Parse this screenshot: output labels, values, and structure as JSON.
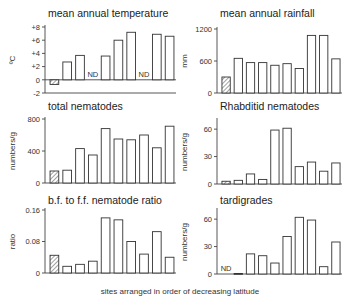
{
  "figure": {
    "xlabel": "sites arranged in order of decreasing latitude"
  },
  "chart_data": [
    {
      "id": "temperature",
      "type": "bar",
      "title": "mean annual temperature",
      "ylabel": "ºC",
      "ylim": [
        -2,
        8
      ],
      "yticks": [
        8,
        6,
        4,
        2,
        0,
        -2
      ],
      "ytick_labels": [
        "+8",
        "+6",
        "+4",
        "+2",
        "0",
        "-2"
      ],
      "categories": [
        "site 1",
        "site 2",
        "site 3",
        "site 4",
        "site 5",
        "site 6",
        "site 7",
        "site 8",
        "site 9",
        "site 10"
      ],
      "values": [
        -0.7,
        2.7,
        3.7,
        null,
        3.6,
        6.0,
        7.2,
        null,
        6.9,
        6.6
      ],
      "hatched": [
        true,
        false,
        false,
        false,
        false,
        false,
        false,
        false,
        false,
        false
      ],
      "nd_label": "ND",
      "baseline_line": true
    },
    {
      "id": "rainfall",
      "type": "bar",
      "title": "mean annual rainfall",
      "ylabel": "mm",
      "ylim": [
        0,
        1200
      ],
      "yticks": [
        1200,
        600,
        0
      ],
      "ytick_labels": [
        "1200",
        "600",
        "0"
      ],
      "categories": [
        "site 1",
        "site 2",
        "site 3",
        "site 4",
        "site 5",
        "site 6",
        "site 7",
        "site 8",
        "site 9",
        "site 10"
      ],
      "values": [
        300,
        650,
        570,
        570,
        520,
        550,
        460,
        1080,
        1080,
        640
      ],
      "hatched": [
        true,
        false,
        false,
        false,
        false,
        false,
        false,
        false,
        false,
        false
      ],
      "nd_label": "ND"
    },
    {
      "id": "total-nematodes",
      "type": "bar",
      "title": "total nematodes",
      "ylabel": "numbers/g",
      "ylim": [
        0,
        800
      ],
      "yticks": [
        800,
        400,
        0
      ],
      "ytick_labels": [
        "800",
        "400",
        "0"
      ],
      "categories": [
        "site 1",
        "site 2",
        "site 3",
        "site 4",
        "site 5",
        "site 6",
        "site 7",
        "site 8",
        "site 9",
        "site 10"
      ],
      "values": [
        150,
        160,
        430,
        350,
        680,
        550,
        540,
        600,
        440,
        710
      ],
      "hatched": [
        true,
        false,
        false,
        false,
        false,
        false,
        false,
        false,
        false,
        false
      ],
      "nd_label": "ND"
    },
    {
      "id": "rhabditid-nematodes",
      "type": "bar",
      "title": "Rhabditid nematodes",
      "ylabel": "numbers/g",
      "ylim": [
        0,
        70
      ],
      "yticks": [
        60,
        30,
        0
      ],
      "ytick_labels": [
        "60",
        "30",
        "0"
      ],
      "categories": [
        "site 1",
        "site 2",
        "site 3",
        "site 4",
        "site 5",
        "site 6",
        "site 7",
        "site 8",
        "site 9",
        "site 10"
      ],
      "values": [
        3,
        4,
        11,
        5,
        59,
        61,
        19,
        24,
        14,
        23
      ],
      "hatched": [
        true,
        false,
        false,
        false,
        false,
        false,
        false,
        false,
        false,
        false
      ],
      "nd_label": "ND"
    },
    {
      "id": "bf-ff-ratio",
      "type": "bar",
      "title": "b.f. to f.f. nematode ratio",
      "ylabel": "ratio",
      "ylim": [
        0,
        0.16
      ],
      "yticks": [
        0.16,
        0.08,
        0
      ],
      "ytick_labels": [
        "0.16",
        "0.08",
        "0"
      ],
      "categories": [
        "site 1",
        "site 2",
        "site 3",
        "site 4",
        "site 5",
        "site 6",
        "site 7",
        "site 8",
        "site 9",
        "site 10"
      ],
      "values": [
        0.045,
        0.017,
        0.022,
        0.03,
        0.14,
        0.135,
        0.08,
        0.048,
        0.105,
        0.04
      ],
      "hatched": [
        true,
        false,
        false,
        false,
        false,
        false,
        false,
        false,
        false,
        false
      ],
      "nd_label": "ND"
    },
    {
      "id": "tardigrades",
      "type": "bar",
      "title": "tardigrades",
      "ylabel": "numbers/g",
      "ylim": [
        0,
        70
      ],
      "yticks": [
        60,
        30,
        0
      ],
      "ytick_labels": [
        "60",
        "30",
        "0"
      ],
      "categories": [
        "site 1",
        "site 2",
        "site 3",
        "site 4",
        "site 5",
        "site 6",
        "site 7",
        "site 8",
        "site 9",
        "site 10"
      ],
      "values": [
        null,
        0.5,
        22,
        20,
        12,
        41,
        62,
        59,
        8,
        35
      ],
      "hatched": [
        false,
        false,
        false,
        false,
        false,
        false,
        false,
        false,
        false,
        false
      ],
      "nd_label": "ND"
    }
  ]
}
